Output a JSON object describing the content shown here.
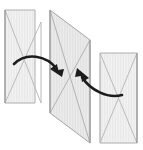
{
  "figure": {
    "type": "geometric-diagram",
    "canvas": {
      "width": 143,
      "height": 150,
      "background": "#ffffff"
    },
    "style": {
      "plane_fill": "#f1f1f1",
      "plane_fill_shaded": "#e8e8e8",
      "plane_stroke": "#9a9a9a",
      "plane_stroke_light": "#bdbdbd",
      "diagonal_stroke": "#a8a8a8",
      "hatch_stroke": "#dcdcdc",
      "arrow_color": "#1c1c1c",
      "plane_stroke_width": 1,
      "diagonal_stroke_width": 0.9,
      "arrow_stroke_width": 2.6
    },
    "planes": [
      {
        "name": "left-plane",
        "label": "Plane 1",
        "points": "5,10 35,10 35,103 5,103",
        "quad": [
          [
            5,
            10
          ],
          [
            35,
            10
          ],
          [
            35,
            103
          ],
          [
            5,
            103
          ]
        ],
        "skew_points": "5,10 41,22 41,103 5,103",
        "diagonals": [
          {
            "from": [
              5,
              10
            ],
            "to": [
              41,
              103
            ]
          },
          {
            "from": [
              5,
              103
            ],
            "to": [
              41,
              22
            ]
          }
        ]
      },
      {
        "name": "middle-plane",
        "label": "Plane 2",
        "points": "50,10 90,40 90,143 50,113",
        "quad": [
          [
            50,
            10
          ],
          [
            90,
            40
          ],
          [
            90,
            143
          ],
          [
            50,
            113
          ]
        ],
        "diagonals": [
          {
            "from": [
              50,
              10
            ],
            "to": [
              90,
              143
            ]
          },
          {
            "from": [
              50,
              113
            ],
            "to": [
              90,
              40
            ]
          }
        ]
      },
      {
        "name": "right-plane",
        "label": "Plane 3",
        "points": "100,53 137,53 137,143 100,143",
        "quad": [
          [
            100,
            53
          ],
          [
            137,
            53
          ],
          [
            137,
            143
          ],
          [
            100,
            143
          ]
        ],
        "diagonals": [
          {
            "from": [
              100,
              53
            ],
            "to": [
              137,
              143
            ]
          },
          {
            "from": [
              100,
              143
            ],
            "to": [
              137,
              53
            ]
          }
        ]
      }
    ],
    "arrows": [
      {
        "name": "left-fold-arrow",
        "label": "Fold left plane toward center",
        "direction": "rightward",
        "path": "M 14,64 C 26,52 46,55 57,69",
        "head": {
          "tip": [
            60,
            74
          ],
          "angle_deg": 52
        }
      },
      {
        "name": "right-fold-arrow",
        "label": "Fold right plane toward center",
        "direction": "leftward",
        "path": "M 122,95 C 108,99 90,90 82,77",
        "head": {
          "tip": [
            79,
            72
          ],
          "angle_deg": 238
        }
      }
    ]
  }
}
